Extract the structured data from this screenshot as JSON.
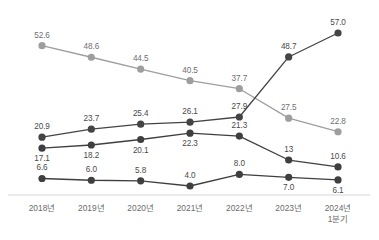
{
  "chart_data": {
    "type": "line",
    "title": "",
    "subtitle": "",
    "xlabel": "",
    "ylabel": "",
    "grid": false,
    "legend_position": "none",
    "xlim": [
      0,
      6
    ],
    "ylim": [
      0,
      60
    ],
    "categories": [
      "2018년",
      "2019년",
      "2020년",
      "2021년",
      "2022년",
      "2023년",
      "2024년"
    ],
    "category_sublabels": [
      "",
      "",
      "",
      "",
      "",
      "",
      "1분기"
    ],
    "series": [
      {
        "name": "series-1",
        "color": "#9e9e9e",
        "marker": "circle",
        "values": [
          52.6,
          48.6,
          44.5,
          40.5,
          37.7,
          27.5,
          22.8
        ],
        "labels": [
          "52.6",
          "48.6",
          "44.5",
          "40.5",
          "37.7",
          "27.5",
          "22.8"
        ],
        "label_positions": [
          "above",
          "above",
          "above",
          "above",
          "above",
          "above",
          "above"
        ]
      },
      {
        "name": "series-2",
        "color": "#444444",
        "marker": "circle",
        "values": [
          20.9,
          23.7,
          25.4,
          26.1,
          27.9,
          48.7,
          57.0
        ],
        "labels": [
          "20.9",
          "23.7",
          "25.4",
          "26.1",
          "27.9",
          "48.7",
          "57.0"
        ],
        "label_positions": [
          "above",
          "above",
          "above",
          "above",
          "above",
          "above",
          "above"
        ]
      },
      {
        "name": "series-3",
        "color": "#3f3f3f",
        "marker": "circle",
        "values": [
          17.1,
          18.2,
          20.1,
          22.3,
          21.3,
          13.0,
          10.6
        ],
        "labels": [
          "17.1",
          "18.2",
          "20.1",
          "22.3",
          "21.3",
          "13",
          "10.6"
        ],
        "label_positions": [
          "below",
          "below",
          "below",
          "below",
          "above",
          "above",
          "above"
        ]
      },
      {
        "name": "series-4",
        "color": "#3f3f3f",
        "marker": "circle",
        "values": [
          6.6,
          6.0,
          5.8,
          4.0,
          8.0,
          7.0,
          6.1
        ],
        "labels": [
          "6.6",
          "6.0",
          "5.8",
          "4.0",
          "8.0",
          "7.0",
          "6.1"
        ],
        "label_positions": [
          "above",
          "above",
          "above",
          "above",
          "above",
          "below",
          "below"
        ]
      }
    ],
    "axis": {
      "show_x_axis_line": true,
      "axis_color": "#d5d5d5"
    }
  }
}
